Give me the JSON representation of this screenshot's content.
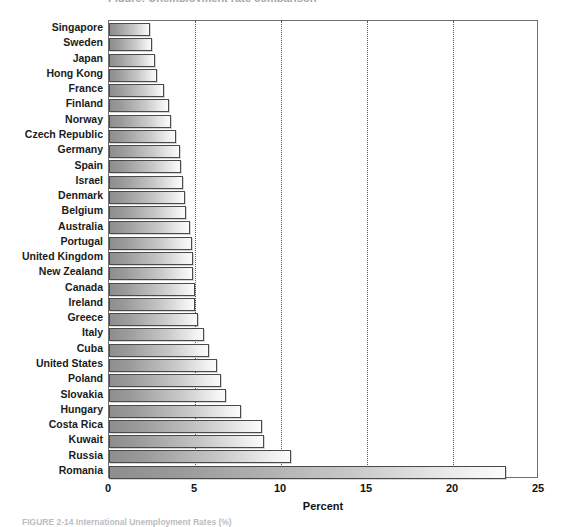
{
  "figure": {
    "top_clipped_title": "Figure: Unemployment rate comparison",
    "caption": "FIGURE 2-14  International Unemployment Rates (%)"
  },
  "chart_data": {
    "type": "bar",
    "orientation": "horizontal",
    "title": "",
    "xlabel": "Percent",
    "ylabel": "",
    "xlim": [
      0,
      25
    ],
    "xticks": [
      "0",
      "5",
      "10",
      "15",
      "20",
      "25"
    ],
    "xtick_values": [
      0,
      5,
      10,
      15,
      20,
      25
    ],
    "grid": "vertical-dotted",
    "legend": "none",
    "categories": [
      "Singapore",
      "Sweden",
      "Japan",
      "Hong Kong",
      "France",
      "Finland",
      "Norway",
      "Czech Republic",
      "Germany",
      "Spain",
      "Israel",
      "Denmark",
      "Belgium",
      "Australia",
      "Portugal",
      "United Kingdom",
      "New Zealand",
      "Canada",
      "Ireland",
      "Greece",
      "Italy",
      "Cuba",
      "United States",
      "Poland",
      "Slovakia",
      "Hungary",
      "Costa Rica",
      "Kuwait",
      "Russia",
      "Romania"
    ],
    "values": [
      2.4,
      2.5,
      2.7,
      2.8,
      3.2,
      3.5,
      3.6,
      3.9,
      4.1,
      4.2,
      4.3,
      4.4,
      4.5,
      4.7,
      4.8,
      4.9,
      4.9,
      5.0,
      5.0,
      5.2,
      5.5,
      5.8,
      6.3,
      6.5,
      6.8,
      7.7,
      8.9,
      9.0,
      10.6,
      23.1
    ]
  }
}
